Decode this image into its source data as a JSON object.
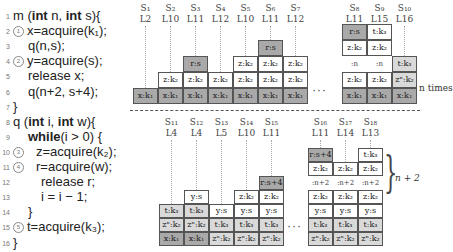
{
  "code": {
    "lines": [
      {
        "n": "1",
        "circle": "",
        "indent": 0,
        "parts": [
          {
            "t": "m (",
            "kw": false
          },
          {
            "t": "int",
            "kw": true
          },
          {
            "t": " n,  ",
            "kw": false
          },
          {
            "t": "int",
            "kw": true
          },
          {
            "t": "  s){",
            "kw": false
          }
        ]
      },
      {
        "n": "2",
        "circle": "1",
        "indent": 0,
        "parts": [
          {
            "t": "x=acquire(k₁);",
            "kw": false
          }
        ]
      },
      {
        "n": "3",
        "circle": "",
        "indent": 1,
        "parts": [
          {
            "t": "q(n,s);",
            "kw": false
          }
        ]
      },
      {
        "n": "4",
        "circle": "2",
        "indent": 0,
        "parts": [
          {
            "t": "y=acquire(s);",
            "kw": false
          }
        ]
      },
      {
        "n": "5",
        "circle": "",
        "indent": 1,
        "parts": [
          {
            "t": "release   x;",
            "kw": false
          }
        ]
      },
      {
        "n": "6",
        "circle": "",
        "indent": 1,
        "parts": [
          {
            "t": "q(n+2, s+4);",
            "kw": false
          }
        ]
      },
      {
        "n": "7",
        "circle": "",
        "indent": 0,
        "parts": [
          {
            "t": "}",
            "kw": false
          }
        ]
      },
      {
        "n": "8",
        "circle": "",
        "indent": 0,
        "parts": [
          {
            "t": "q (",
            "kw": false
          },
          {
            "t": "int",
            "kw": true
          },
          {
            "t": "  i,  ",
            "kw": false
          },
          {
            "t": "int",
            "kw": true
          },
          {
            "t": "  w){",
            "kw": false
          }
        ]
      },
      {
        "n": "9",
        "circle": "",
        "indent": 1,
        "parts": [
          {
            "t": "while",
            "kw": true
          },
          {
            "t": "(i  > 0) {",
            "kw": false
          }
        ]
      },
      {
        "n": "10",
        "circle": "3",
        "indent": 2,
        "parts": [
          {
            "t": "z=acquire(k₂);",
            "kw": false
          }
        ]
      },
      {
        "n": "11",
        "circle": "4",
        "indent": 2,
        "parts": [
          {
            "t": "r=acquire(w);",
            "kw": false
          }
        ]
      },
      {
        "n": "12",
        "circle": "",
        "indent": 2,
        "parts": [
          {
            "t": "release   r;",
            "kw": false
          }
        ]
      },
      {
        "n": "13",
        "circle": "",
        "indent": 2,
        "parts": [
          {
            "t": "i  = i − 1;",
            "kw": false
          }
        ]
      },
      {
        "n": "14",
        "circle": "",
        "indent": 1,
        "parts": [
          {
            "t": "}",
            "kw": false
          }
        ]
      },
      {
        "n": "15",
        "circle": "5",
        "indent": 0,
        "parts": [
          {
            "t": "t=acquire(k₃);",
            "kw": false
          }
        ]
      },
      {
        "n": "16",
        "circle": "",
        "indent": 0,
        "parts": [
          {
            "t": "}",
            "kw": false
          }
        ]
      }
    ]
  },
  "top_states": [
    {
      "s": "S₁",
      "l": "L2",
      "cells": [
        {
          "t": "x:k₁",
          "c": "dark"
        }
      ]
    },
    {
      "s": "S₂",
      "l": "L10",
      "cells": [
        {
          "t": "x:k₁",
          "c": "dark"
        },
        {
          "t": "z:k₂",
          "c": "white"
        }
      ]
    },
    {
      "s": "S₃",
      "l": "L11",
      "cells": [
        {
          "t": "x:k₁",
          "c": "dark"
        },
        {
          "t": "z:k₂",
          "c": "white"
        },
        {
          "t": "r:s",
          "c": "dark"
        }
      ]
    },
    {
      "s": "S₄",
      "l": "L12",
      "cells": [
        {
          "t": "x:k₁",
          "c": "dark"
        },
        {
          "t": "z:k₂",
          "c": "white"
        }
      ]
    },
    {
      "s": "S₅",
      "l": "L10",
      "cells": [
        {
          "t": "x:k₁",
          "c": "dark"
        },
        {
          "t": "z:k₂",
          "c": "white"
        },
        {
          "t": "z:k₂",
          "c": "white"
        }
      ]
    },
    {
      "s": "S₆",
      "l": "L11",
      "cells": [
        {
          "t": "x:k₁",
          "c": "dark"
        },
        {
          "t": "z:k₂",
          "c": "white"
        },
        {
          "t": "z:k₂",
          "c": "white"
        },
        {
          "t": "r:s",
          "c": "dark"
        }
      ]
    },
    {
      "s": "S₇",
      "l": "L12",
      "cells": [
        {
          "t": "x:k₁",
          "c": "dark"
        },
        {
          "t": "z:k₂",
          "c": "white"
        },
        {
          "t": "z:k₂",
          "c": "white"
        }
      ]
    }
  ],
  "top_states_right": [
    {
      "s": "S₈",
      "l": "L11",
      "cells": [
        {
          "t": "x:k₁",
          "c": "dark"
        },
        {
          "t": "z:k₂",
          "c": "white"
        },
        {
          "t": ":n",
          "c": "gap"
        },
        {
          "t": "z:k₂",
          "c": "white"
        },
        {
          "t": "r:s",
          "c": "dark"
        }
      ]
    },
    {
      "s": "S₉",
      "l": "L15",
      "cells": [
        {
          "t": "x:k₁",
          "c": "dark"
        },
        {
          "t": "z:k₂",
          "c": "white"
        },
        {
          "t": ":n",
          "c": "gap"
        },
        {
          "t": "z:k₂",
          "c": "white"
        },
        {
          "t": "t:k₃",
          "c": "white"
        }
      ]
    },
    {
      "s": "S₁₀",
      "l": "L16",
      "cells": [
        {
          "t": "x:k₁",
          "c": "dark"
        },
        {
          "t": "zⁿ:k₂",
          "c": "light"
        },
        {
          "t": "t:k₃",
          "c": "light"
        }
      ]
    }
  ],
  "top_note": "n times",
  "ellipsis": "···",
  "bottom_states": [
    {
      "s": "S₁₁",
      "l": "L4",
      "cells": [
        {
          "t": "x:k₁",
          "c": "dark"
        },
        {
          "t": "zⁿ:k₂",
          "c": "light"
        },
        {
          "t": "t:k₃",
          "c": "light"
        }
      ]
    },
    {
      "s": "S₁₂",
      "l": "L4",
      "cells": [
        {
          "t": "x:k₁",
          "c": "dark"
        },
        {
          "t": "zⁿ:k₂",
          "c": "light"
        },
        {
          "t": "t:k₃",
          "c": "light"
        },
        {
          "t": "y:s",
          "c": "white"
        }
      ]
    },
    {
      "s": "S₁₃",
      "l": "L5",
      "cells": [
        {
          "t": "zⁿ:k₂",
          "c": "light"
        },
        {
          "t": "t:k₃",
          "c": "light"
        },
        {
          "t": "y:s",
          "c": "white"
        }
      ]
    },
    {
      "s": "S₁₄",
      "l": "L10",
      "cells": [
        {
          "t": "zⁿ:k₂",
          "c": "light"
        },
        {
          "t": "t:k₃",
          "c": "light"
        },
        {
          "t": "y:s",
          "c": "white"
        },
        {
          "t": "z:k₂",
          "c": "white"
        }
      ]
    },
    {
      "s": "S₁₅",
      "l": "L11",
      "cells": [
        {
          "t": "zⁿ:k₂",
          "c": "light"
        },
        {
          "t": "t:k₃",
          "c": "light"
        },
        {
          "t": "y:s",
          "c": "white"
        },
        {
          "t": "z:k₂",
          "c": "white"
        },
        {
          "t": "r:s+4",
          "c": "dark"
        }
      ]
    }
  ],
  "bottom_states_right": [
    {
      "s": "S₁₆",
      "l": "L11",
      "cells": [
        {
          "t": "zⁿ:k₂",
          "c": "light"
        },
        {
          "t": "t:k₃",
          "c": "light"
        },
        {
          "t": "y:s",
          "c": "white"
        },
        {
          "t": "z:k₂",
          "c": "white"
        },
        {
          "t": ":n+2",
          "c": "gap"
        },
        {
          "t": "z:k₂",
          "c": "white"
        },
        {
          "t": "r:s+4",
          "c": "dark"
        }
      ]
    },
    {
      "s": "S₁₇",
      "l": "L14",
      "cells": [
        {
          "t": "zⁿ:k₂",
          "c": "light"
        },
        {
          "t": "t:k₃",
          "c": "light"
        },
        {
          "t": "y:s",
          "c": "white"
        },
        {
          "t": "z:k₂",
          "c": "white"
        },
        {
          "t": ":n+2",
          "c": "gap"
        },
        {
          "t": "z:k₂",
          "c": "white"
        }
      ]
    },
    {
      "s": "S₁₈",
      "l": "L13",
      "cells": [
        {
          "t": "zⁿ:k₂",
          "c": "light"
        },
        {
          "t": "t:k₃",
          "c": "light"
        },
        {
          "t": "y:s",
          "c": "white"
        },
        {
          "t": "z:k₂",
          "c": "white"
        },
        {
          "t": ":n+2",
          "c": "gap"
        },
        {
          "t": "z:k₂",
          "c": "white"
        },
        {
          "t": "t:k₃",
          "c": "white"
        }
      ]
    }
  ],
  "bottom_note": "n + 2",
  "colors": {
    "dark": "#a9a9a9",
    "light": "#d9d9d9",
    "white": "#ffffff",
    "border": "#555555"
  }
}
